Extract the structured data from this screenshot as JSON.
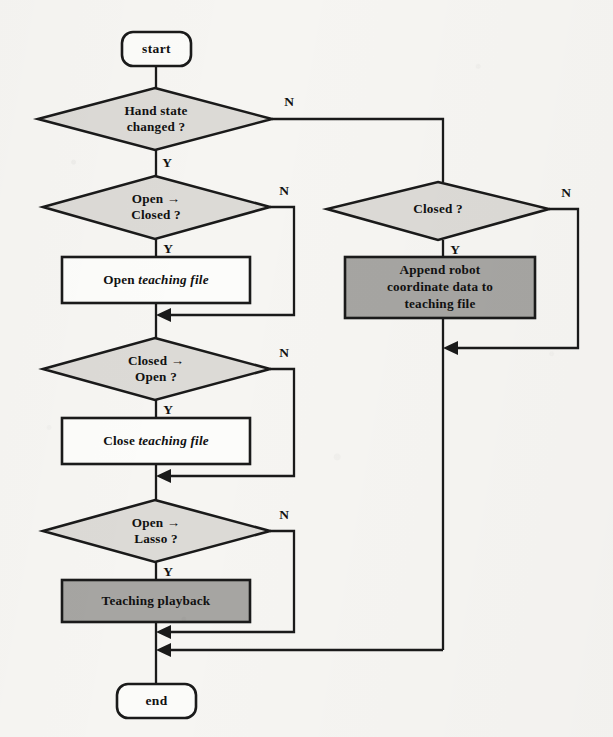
{
  "diagram": {
    "colors": {
      "background": "#f6f5f2",
      "stroke": "#1a1a1a",
      "terminator_fill": "#fbfbf9",
      "decision_fill": "#dcdad6",
      "process_white_fill": "#fcfcfa",
      "process_gray_fill": "#a6a5a2"
    },
    "nodes": {
      "start": {
        "type": "terminator",
        "label": "start"
      },
      "hand_state_changed": {
        "type": "decision",
        "line1": "Hand state",
        "line2": "changed ?"
      },
      "open_to_closed": {
        "type": "decision",
        "line1": "Open →",
        "line2": "Closed ?"
      },
      "open_teaching_file": {
        "type": "process",
        "text_plain": "Open ",
        "text_italic": "teaching file"
      },
      "closed_to_open": {
        "type": "decision",
        "line1": "Closed →",
        "line2": "Open ?"
      },
      "close_teaching_file": {
        "type": "process",
        "text_plain": "Close ",
        "text_italic": "teaching file"
      },
      "open_to_lasso": {
        "type": "decision",
        "line1": "Open →",
        "line2": "Lasso ?"
      },
      "teaching_playback": {
        "type": "process-gray",
        "label": "Teaching playback"
      },
      "closed": {
        "type": "decision",
        "label": "Closed ?"
      },
      "append_robot_data": {
        "type": "process-gray",
        "line1": "Append robot",
        "line2": "coordinate data to",
        "line3": "teaching file"
      },
      "end": {
        "type": "terminator",
        "label": "end"
      }
    },
    "branch_labels": {
      "hand_state_changed_no": "N",
      "hand_state_changed_yes": "Y",
      "open_to_closed_no": "N",
      "open_to_closed_yes": "Y",
      "closed_to_open_no": "N",
      "closed_to_open_yes": "Y",
      "open_to_lasso_no": "N",
      "open_to_lasso_yes": "Y",
      "closed_no": "N",
      "closed_yes": "Y"
    }
  }
}
